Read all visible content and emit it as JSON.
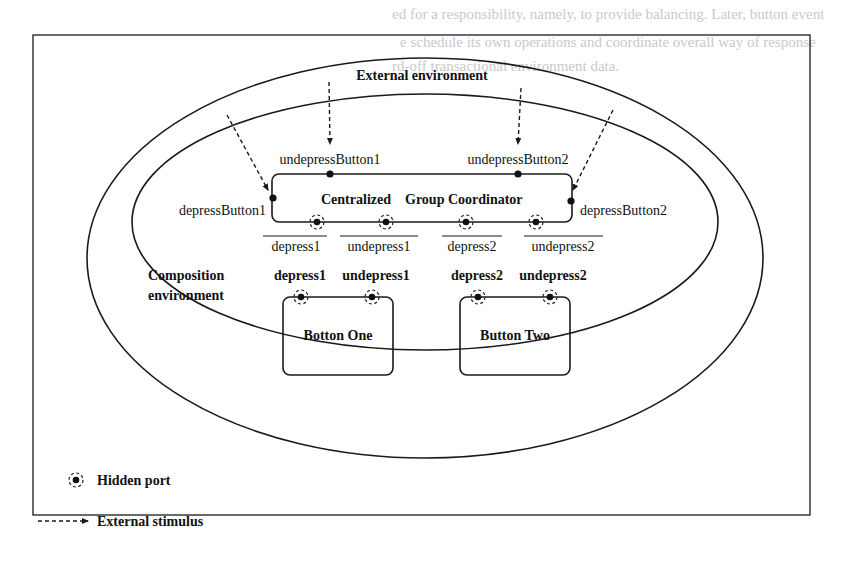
{
  "background_bleed": {
    "lines": [
      "ed for a responsibility, namely, to provide balancing. Later, button event",
      "e schedule its own operations and coordinate overall way of response",
      "rd-off transactional environment data."
    ]
  },
  "diagram": {
    "environments": {
      "external_label": "External environment",
      "composition_label_line1": "Composition",
      "composition_label_line2": "environment"
    },
    "coordinator": {
      "title_word1": "Centralized",
      "title_word2": "Group Coordinator",
      "ports": {
        "undepress_button1": "undepressButton1",
        "undepress_button2": "undepressButton2",
        "depress_button1": "depressButton1",
        "depress_button2": "depressButton2"
      },
      "hidden_ports": [
        {
          "label": "depress1"
        },
        {
          "label": "undepress1"
        },
        {
          "label": "depress2"
        },
        {
          "label": "undepress2"
        }
      ]
    },
    "buttons": [
      {
        "name": "Botton One",
        "ports": [
          "depress1",
          "undepress1"
        ]
      },
      {
        "name": "Button Two",
        "ports": [
          "depress2",
          "undepress2"
        ]
      }
    ],
    "legend": {
      "hidden_port": "Hidden port",
      "external_stimulus": "External stimulus"
    },
    "colors": {
      "line": "#1a1a1a",
      "text": "#111111",
      "background": "#ffffff",
      "bleed_text": "#c9c9c9"
    }
  }
}
